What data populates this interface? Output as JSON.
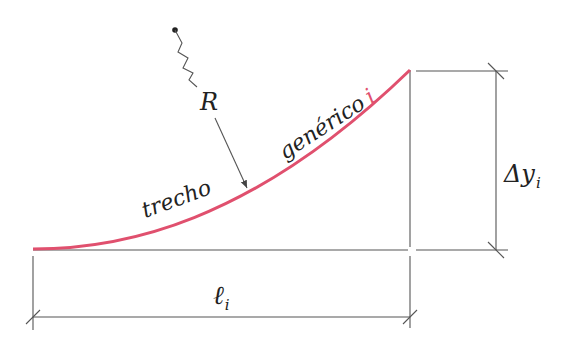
{
  "labels": {
    "radius": "R",
    "segment_word1": "trecho",
    "segment_word2": "genérico",
    "segment_index": "i",
    "delta_y": "Δy",
    "delta_y_sub": "i",
    "length": "ℓ",
    "length_sub": "i"
  },
  "colors": {
    "curve": "#e0506e",
    "index": "#e0506e",
    "lines": "#555555",
    "text": "#222222"
  }
}
